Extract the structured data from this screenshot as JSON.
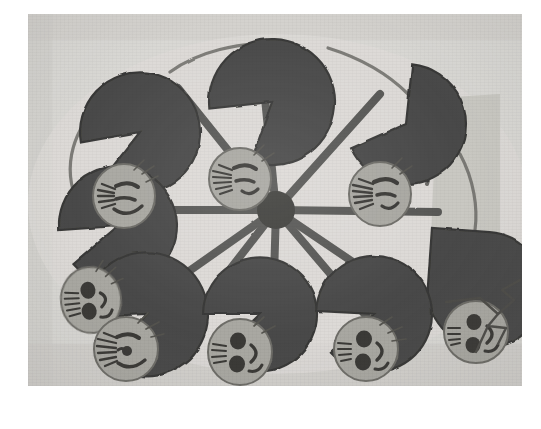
{
  "scene": {
    "title": "Hand-drawn circle of pac-man figures with faces",
    "medium": "photograph of a pencil and marker drawing on paper",
    "photo": {
      "x": 28,
      "y": 14,
      "width": 494,
      "height": 372
    },
    "colors": {
      "paper_border": "#ffffff",
      "background": "#d9d8d4",
      "background_shadow": "#c9c8c3",
      "pac_fill": "#4a4a48",
      "pac_stroke": "#3a3a38",
      "spoke": "#5a5a57",
      "face_fill": "#a9a8a2",
      "face_stroke": "#6e6d68",
      "feature_ink": "#3b3a37",
      "cone_fill": "#c6c5c0"
    },
    "hub": {
      "cx": 248,
      "cy": 196,
      "radius": 18,
      "spoke_count": 10
    },
    "light_cone": {
      "name": "light-cone-shape",
      "points": "409,84 470,84 470,300 405,268"
    },
    "pac_figures": [
      {
        "id": "pac-top-center",
        "cx": 244,
        "cy": 88,
        "r": 63,
        "mouth_angle": 112,
        "mouth_spread": 34,
        "rotation": -4
      },
      {
        "id": "pac-top-left",
        "cx": 112,
        "cy": 118,
        "r": 60,
        "mouth_angle": 92,
        "mouth_spread": 33,
        "rotation": -8
      },
      {
        "id": "pac-top-right",
        "cx": 378,
        "cy": 110,
        "r": 60,
        "mouth_angle": 150,
        "mouth_spread": 32,
        "rotation": 6
      },
      {
        "id": "pac-left",
        "cx": 90,
        "cy": 212,
        "r": 59,
        "mouth_angle": 80,
        "mouth_spread": 34,
        "rotation": -3
      },
      {
        "id": "pac-right",
        "cx": 404,
        "cy": 214,
        "r": 58,
        "mouth_angle": 170,
        "mouth_spread": 34,
        "rotation": 4
      },
      {
        "id": "pac-bottom-left",
        "cx": 118,
        "cy": 300,
        "r": 62,
        "mouth_angle": 62,
        "mouth_spread": 33,
        "rotation": -2
      },
      {
        "id": "pac-bottom-center",
        "cx": 232,
        "cy": 300,
        "r": 57,
        "mouth_angle": 66,
        "mouth_spread": 33,
        "rotation": 0
      },
      {
        "id": "pac-bottom-right",
        "cx": 344,
        "cy": 300,
        "r": 58,
        "mouth_angle": 62,
        "mouth_spread": 33,
        "rotation": 3
      },
      {
        "id": "pac-upper-left-inner",
        "cx": 112,
        "cy": 118,
        "r": 0,
        "mouth_angle": 0,
        "mouth_spread": 0,
        "rotation": 0
      }
    ],
    "faces": [
      {
        "id": "face-top-left",
        "cx": 96,
        "cy": 182,
        "rx": 31,
        "ry": 32,
        "expression": "smiling",
        "hair": "left-spray",
        "mouth": "wide-smile",
        "eyes": "slit"
      },
      {
        "id": "face-top-center",
        "cx": 212,
        "cy": 165,
        "rx": 31,
        "ry": 31,
        "expression": "smiling",
        "hair": "left-spray",
        "mouth": "small-smile",
        "eyes": "slit"
      },
      {
        "id": "face-top-right",
        "cx": 352,
        "cy": 180,
        "rx": 31,
        "ry": 32,
        "expression": "smiling",
        "hair": "left-spray",
        "mouth": "small-smile",
        "eyes": "slit"
      },
      {
        "id": "face-left",
        "cx": 63,
        "cy": 286,
        "rx": 30,
        "ry": 33,
        "expression": "smiling",
        "hair": "left-lines",
        "mouth": "wide-smile",
        "eyes": "round"
      },
      {
        "id": "face-bottom-left",
        "cx": 98,
        "cy": 335,
        "rx": 32,
        "ry": 32,
        "expression": "smiling",
        "hair": "left-spray",
        "mouth": "wide-smile",
        "eyes": "slit"
      },
      {
        "id": "face-bottom-center",
        "cx": 212,
        "cy": 338,
        "rx": 32,
        "ry": 33,
        "expression": "smiling",
        "hair": "left-lines",
        "mouth": "wide-smile",
        "eyes": "round"
      },
      {
        "id": "face-bottom-right",
        "cx": 338,
        "cy": 335,
        "rx": 32,
        "ry": 32,
        "expression": "smiling",
        "hair": "left-lines",
        "mouth": "wide-smile",
        "eyes": "round"
      },
      {
        "id": "face-detached",
        "cx": 448,
        "cy": 318,
        "rx": 32,
        "ry": 31,
        "expression": "smiling",
        "hair": "left-lines",
        "mouth": "wide-smile",
        "eyes": "round"
      }
    ],
    "connector_squiggle": {
      "name": "squiggle-antenna",
      "path": "M 470 300 L 486 284 L 474 272 L 492 262 L 478 252"
    },
    "rim_links": [
      "M 52 188 C 34 150 50 116 70 96",
      "M 140 62 C 170 38 208 32 244 30",
      "M 300 36 C 330 44 356 58 378 78",
      "M 430 142 C 444 166 448 192 446 214",
      "M 440 254 C 432 280 412 296 396 304"
    ]
  }
}
